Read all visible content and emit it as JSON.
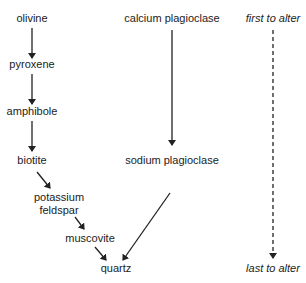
{
  "diagram": {
    "left_series": {
      "nodes": [
        "olivine",
        "pyroxene",
        "amphibole",
        "biotite",
        "potassium feldspar",
        "muscovite",
        "quartz"
      ]
    },
    "right_series": {
      "nodes": [
        "calcium plagioclase",
        "sodium plagioclase"
      ]
    },
    "scale": {
      "top_label": "first to alter",
      "bottom_label": "last to alter"
    },
    "labels": {
      "olivine": "olivine",
      "pyroxene": "pyroxene",
      "amphibole": "amphibole",
      "biotite": "biotite",
      "potassium": "potassium",
      "feldspar": "feldspar",
      "muscovite": "muscovite",
      "quartz": "quartz",
      "calcium_plagioclase": "calcium plagioclase",
      "sodium_plagioclase": "sodium plagioclase",
      "first_to_alter": "first to alter",
      "last_to_alter": "last to alter"
    },
    "colors": {
      "line": "#222222",
      "text": "#222222"
    }
  }
}
